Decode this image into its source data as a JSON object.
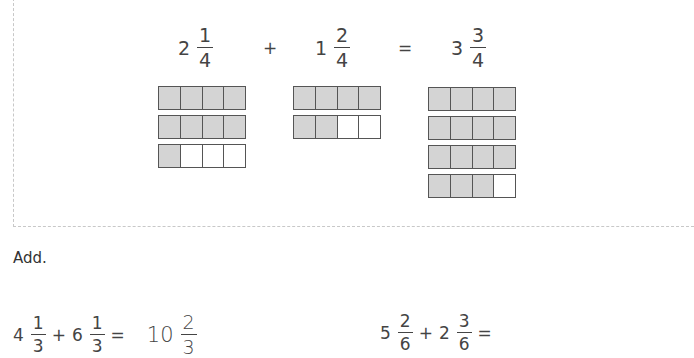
{
  "example": {
    "term1": {
      "whole": "2",
      "num": "1",
      "den": "4"
    },
    "plus": "+",
    "term2": {
      "whole": "1",
      "num": "2",
      "den": "4"
    },
    "equals": "=",
    "result": {
      "whole": "3",
      "num": "3",
      "den": "4"
    },
    "models": [
      {
        "rows": [
          [
            1,
            1,
            1,
            1
          ],
          [
            1,
            1,
            1,
            1
          ],
          [
            1,
            0,
            0,
            0
          ]
        ]
      },
      {
        "rows": [
          [
            1,
            1,
            1,
            1
          ],
          [
            1,
            1,
            0,
            0
          ]
        ]
      },
      {
        "rows": [
          [
            1,
            1,
            1,
            1
          ],
          [
            1,
            1,
            1,
            1
          ],
          [
            1,
            1,
            1,
            1
          ],
          [
            1,
            1,
            1,
            0
          ]
        ]
      }
    ]
  },
  "instruction": "Add.",
  "questions": [
    {
      "a": {
        "whole": "4",
        "num": "1",
        "den": "3"
      },
      "plus": "+",
      "b": {
        "whole": "6",
        "num": "1",
        "den": "3"
      },
      "equals": "=",
      "answer": {
        "whole": "10",
        "num": "2",
        "den": "3"
      }
    },
    {
      "a": {
        "whole": "5",
        "num": "2",
        "den": "6"
      },
      "plus": "+",
      "b": {
        "whole": "2",
        "num": "3",
        "den": "6"
      },
      "equals": "="
    }
  ]
}
